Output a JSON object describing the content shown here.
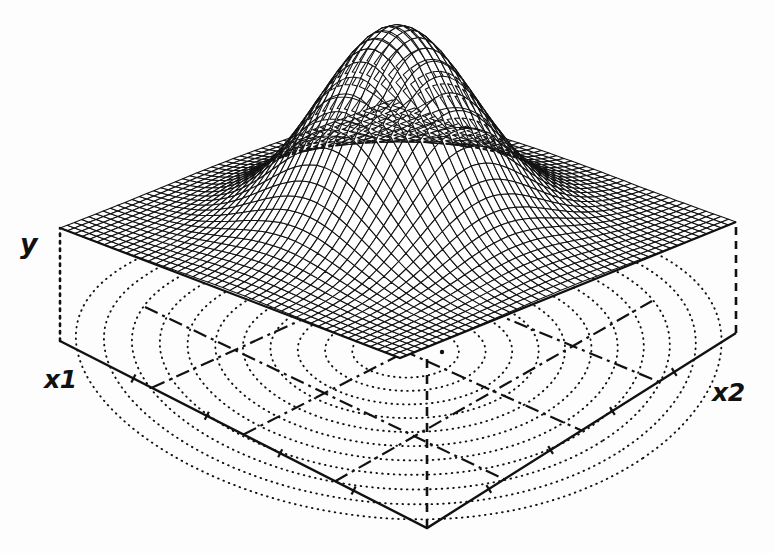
{
  "figure": {
    "type": "3d-surface-plot",
    "background_color": "#ffffff",
    "line_color": "#111111"
  },
  "axes": {
    "vertical": {
      "name": "y-axis",
      "label": "y"
    },
    "left_horizontal": {
      "name": "x1-axis",
      "label": "x1"
    },
    "right_horizontal": {
      "name": "x2-axis",
      "label": "x2"
    }
  },
  "chart_data": {
    "type": "surface",
    "title": "",
    "xlabel": "x1",
    "ylabel": "x2",
    "zlabel": "y",
    "surface": {
      "function": "gaussian-bump",
      "peak_height_fraction": 1.0,
      "baseline_height_fraction": 0.0,
      "peak_center": [
        0.5,
        0.5
      ],
      "sigma": 0.17,
      "mesh_rows": 46,
      "mesh_cols": 46
    },
    "contours": {
      "style": "dotted",
      "levels": 11,
      "center": [
        0.5,
        0.5
      ],
      "shape": "concentric-ellipses"
    },
    "base_grid": {
      "style": "dash-dot",
      "divisions_x1": 4,
      "divisions_x2": 4
    },
    "ticks": {
      "x1_count": 4,
      "x2_count": 4,
      "labels": []
    },
    "grid": true,
    "legend": false,
    "ylim": [
      0,
      1
    ]
  },
  "geometry": {
    "base_left": [
      60,
      341
    ],
    "base_front": [
      427,
      528
    ],
    "base_right": [
      736,
      333
    ],
    "base_back": [
      400,
      205
    ],
    "plane_left": [
      60,
      228
    ],
    "plane_front": [
      400,
      358
    ],
    "plane_right": [
      736,
      222
    ],
    "plane_back": [
      392,
      100
    ],
    "contour_center": [
      442,
      352
    ],
    "dome_apex": [
      430,
      28
    ]
  }
}
